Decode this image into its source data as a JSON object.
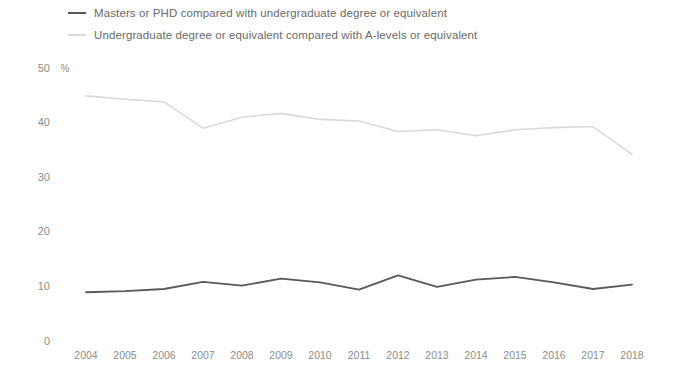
{
  "legend": {
    "position": "top-left",
    "entries": [
      {
        "label": "Masters or PHD compared with undergraduate degree or equivalent",
        "color": "#595959",
        "swatch": "dark"
      },
      {
        "label": "Undergraduate degree or equivalent compared with A-levels or equivalent",
        "color": "#d9d9d9",
        "swatch": "light"
      }
    ]
  },
  "axes": {
    "y_unit": "%",
    "y_ticks": [
      "0",
      "10",
      "20",
      "30",
      "40",
      "50"
    ],
    "x_ticks": [
      "2004",
      "2005",
      "2006",
      "2007",
      "2008",
      "2009",
      "2010",
      "2011",
      "2012",
      "2013",
      "2014",
      "2015",
      "2016",
      "2017",
      "2018"
    ]
  },
  "chart_data": {
    "type": "line",
    "title": "",
    "subtitle": "",
    "xlabel": "",
    "ylabel": "%",
    "x": [
      2004,
      2005,
      2006,
      2007,
      2008,
      2009,
      2010,
      2011,
      2012,
      2013,
      2014,
      2015,
      2016,
      2017,
      2018
    ],
    "categories": [
      "2004",
      "2005",
      "2006",
      "2007",
      "2008",
      "2009",
      "2010",
      "2011",
      "2012",
      "2013",
      "2014",
      "2015",
      "2016",
      "2017",
      "2018"
    ],
    "series": [
      {
        "name": "Masters or PHD compared with undergraduate degree or equivalent",
        "color": "#595959",
        "values": [
          9.0,
          9.2,
          9.6,
          10.9,
          10.2,
          11.5,
          10.8,
          9.5,
          12.1,
          10.0,
          11.3,
          11.8,
          10.8,
          9.6,
          10.4
        ]
      },
      {
        "name": "Undergraduate degree or equivalent compared with A-levels or equivalent",
        "color": "#d9d9d9",
        "values": [
          44.9,
          44.3,
          43.8,
          39.0,
          41.0,
          41.7,
          40.6,
          40.3,
          38.4,
          38.7,
          37.6,
          38.7,
          39.1,
          39.3,
          34.2
        ]
      }
    ],
    "ylim": [
      0,
      50
    ],
    "yticks": [
      0,
      10,
      20,
      30,
      40,
      50
    ],
    "grid": false,
    "legend_position": "top-left"
  }
}
